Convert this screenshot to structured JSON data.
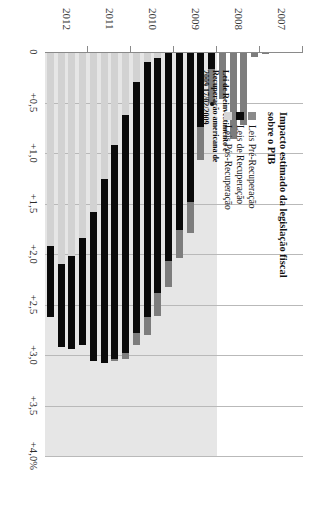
{
  "chart_data": {
    "type": "bar",
    "orientation": "vertical-stacked",
    "title": "Impacto estimado da legislação fiscal sobre o PIB",
    "xlabel": "",
    "ylabel": "",
    "ylim": [
      0,
      4.0
    ],
    "grid": true,
    "legend_position": "top-left",
    "value_ticks": [
      "0",
      "+0,5",
      "+1,0",
      "+1,5",
      "+2,0",
      "+2,5",
      "+3,0",
      "+3,5",
      "+4,0%"
    ],
    "value_tick_values": [
      0,
      0.5,
      1.0,
      1.5,
      2.0,
      2.5,
      3.0,
      3.5,
      4.0
    ],
    "categories": [
      "2007",
      "2008",
      "2009",
      "2010",
      "2011",
      "2012"
    ],
    "series": [
      {
        "name": "Leis Pré-Recuperação",
        "color": "#7d7d7d"
      },
      {
        "name": "Leis de Recuperação",
        "color": "#0a0a0a"
      },
      {
        "name": "Leis Pós-Recuperação",
        "color": "#d2d2d2"
      }
    ],
    "periods": [
      {
        "label": "2007 Q1",
        "year": 2007,
        "pre": 0.0,
        "rec": 0.0,
        "post": 0.0
      },
      {
        "label": "2007 Q2",
        "year": 2007,
        "pre": 0.0,
        "rec": 0.0,
        "post": 0.0
      },
      {
        "label": "2007 Q3",
        "year": 2007,
        "pre": 0.0,
        "rec": 0.0,
        "post": 0.0
      },
      {
        "label": "2007 Q4",
        "year": 2007,
        "pre": 0.02,
        "rec": 0.0,
        "post": 0.0
      },
      {
        "label": "2008 Q1",
        "year": 2008,
        "pre": 0.05,
        "rec": 0.0,
        "post": 0.0
      },
      {
        "label": "2008 Q2",
        "year": 2008,
        "pre": 0.72,
        "rec": 0.0,
        "post": 0.0
      },
      {
        "label": "2008 Q3",
        "year": 2008,
        "pre": 0.86,
        "rec": 0.0,
        "post": 0.0
      },
      {
        "label": "2008 Q4",
        "year": 2008,
        "pre": 0.47,
        "rec": 0.0,
        "post": 0.0
      },
      {
        "label": "2009 Q1",
        "year": 2009,
        "pre": 0.34,
        "rec": 0.17,
        "post": 0.0
      },
      {
        "label": "2009 Q2",
        "year": 2009,
        "pre": 0.33,
        "rec": 0.74,
        "post": 0.0
      },
      {
        "label": "2009 Q3",
        "year": 2009,
        "pre": 0.3,
        "rec": 1.49,
        "post": 0.0
      },
      {
        "label": "2009 Q4",
        "year": 2009,
        "pre": 0.28,
        "rec": 1.76,
        "post": 0.0
      },
      {
        "label": "2010 Q1",
        "year": 2010,
        "pre": 0.26,
        "rec": 2.07,
        "post": 0.0
      },
      {
        "label": "2010 Q2",
        "year": 2010,
        "pre": 0.22,
        "rec": 2.33,
        "post": 0.06
      },
      {
        "label": "2010 Q3",
        "year": 2010,
        "pre": 0.18,
        "rec": 2.52,
        "post": 0.1
      },
      {
        "label": "2010 Q4",
        "year": 2010,
        "pre": 0.12,
        "rec": 2.48,
        "post": 0.3
      },
      {
        "label": "2011 Q1",
        "year": 2011,
        "pre": 0.06,
        "rec": 2.36,
        "post": 0.62
      },
      {
        "label": "2011 Q2",
        "year": 2011,
        "pre": 0.02,
        "rec": 2.12,
        "post": 0.92
      },
      {
        "label": "2011 Q3",
        "year": 2011,
        "pre": 0.0,
        "rec": 1.82,
        "post": 1.26
      },
      {
        "label": "2011 Q4",
        "year": 2011,
        "pre": 0.0,
        "rec": 1.48,
        "post": 1.58
      },
      {
        "label": "2012 Q1",
        "year": 2012,
        "pre": 0.0,
        "rec": 1.06,
        "post": 1.84
      },
      {
        "label": "2012 Q2",
        "year": 2012,
        "pre": 0.0,
        "rec": 0.92,
        "post": 2.02
      },
      {
        "label": "2012 Q3",
        "year": 2012,
        "pre": 0.0,
        "rec": 0.82,
        "post": 2.1
      },
      {
        "label": "2012 Q4",
        "year": 2012,
        "pre": 0.0,
        "rec": 0.7,
        "post": 1.92
      }
    ],
    "annotation": {
      "text": "Lei de Reinvestimento e Recuperação americana de 2009",
      "date": "17/02/2009",
      "points_to_period": "2009 Q1"
    }
  },
  "legend": {
    "title": "Impacto estimado da legislação fiscal sobre o PIB",
    "items": [
      {
        "label": "Leis Pré-Recuperação",
        "swatch": "pre"
      },
      {
        "label": "Leis de Recuperação",
        "swatch": "rec"
      },
      {
        "label": "Leis Pós-Recuperação",
        "swatch": "post"
      }
    ]
  }
}
